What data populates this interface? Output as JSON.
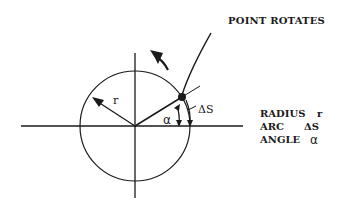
{
  "diagram": {
    "title": "POINT ROTATES",
    "labels": {
      "radius": "r",
      "arc": "ΔS",
      "angle": "α"
    },
    "legend": [
      {
        "name": "RADIUS",
        "symbol": "r"
      },
      {
        "name": "ARC",
        "symbol": "ΔS"
      },
      {
        "name": "ANGLE",
        "symbol": "α"
      }
    ],
    "colors": {
      "ink": "#1a1a1a",
      "background": "#ffffff"
    }
  }
}
